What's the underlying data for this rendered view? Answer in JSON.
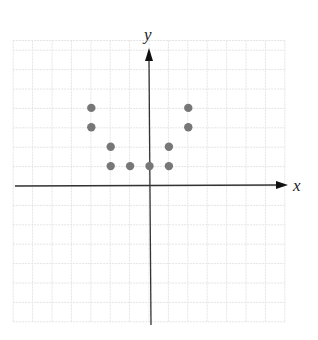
{
  "chart_data": {
    "type": "scatter",
    "title": "",
    "xlabel": "x",
    "ylabel": "y",
    "xlim": [
      -7,
      7
    ],
    "ylim": [
      -7,
      7.5
    ],
    "grid": true,
    "tick_labels": false,
    "series": [
      {
        "name": "points",
        "color": "#777777",
        "points": [
          {
            "x": -3,
            "y": 4
          },
          {
            "x": -3,
            "y": 3
          },
          {
            "x": -2,
            "y": 2
          },
          {
            "x": -2,
            "y": 1
          },
          {
            "x": -1,
            "y": 1
          },
          {
            "x": 0,
            "y": 1
          },
          {
            "x": 1,
            "y": 2
          },
          {
            "x": 1,
            "y": 1
          },
          {
            "x": 2,
            "y": 4
          },
          {
            "x": 2,
            "y": 3
          }
        ]
      }
    ]
  },
  "colors": {
    "grid": "#e4e4e4",
    "axis": "#333333",
    "point": "#777777"
  }
}
